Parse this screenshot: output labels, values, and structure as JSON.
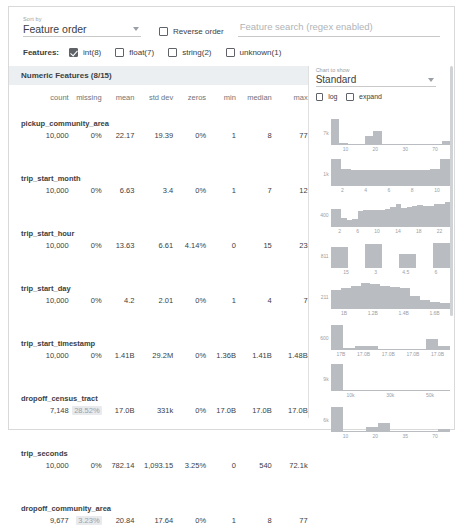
{
  "controls": {
    "sort_caption": "Sort by",
    "sort_value": "Feature order",
    "reverse_label": "Reverse order",
    "reverse_checked": false,
    "search_placeholder": "Feature search (regex enabled)",
    "search_value": "",
    "features_label": "Features:",
    "feature_types": [
      {
        "label": "int(8)",
        "checked": true
      },
      {
        "label": "float(7)",
        "checked": false
      },
      {
        "label": "string(2)",
        "checked": false
      },
      {
        "label": "unknown(1)",
        "checked": false
      }
    ]
  },
  "chart_panel": {
    "caption": "Chart to show",
    "selected": "Standard",
    "options": [
      {
        "label": "log",
        "checked": false
      },
      {
        "label": "expand",
        "checked": false
      }
    ]
  },
  "table": {
    "section_title": "Numeric Features (8/15)",
    "columns": [
      "count",
      "missing",
      "mean",
      "std dev",
      "zeros",
      "min",
      "median",
      "max"
    ],
    "rows": [
      {
        "name": "pickup_community_area",
        "count": "10,000",
        "missing": "0%",
        "missing_alert": false,
        "mean": "22.17",
        "std_dev": "19.39",
        "zeros": "0%",
        "min": "1",
        "median": "8",
        "max": "77"
      },
      {
        "name": "trip_start_month",
        "count": "10,000",
        "missing": "0%",
        "missing_alert": false,
        "mean": "6.63",
        "std_dev": "3.4",
        "zeros": "0%",
        "min": "1",
        "median": "7",
        "max": "12"
      },
      {
        "name": "trip_start_hour",
        "count": "10,000",
        "missing": "0%",
        "missing_alert": false,
        "mean": "13.63",
        "std_dev": "6.61",
        "zeros": "4.14%",
        "min": "0",
        "median": "15",
        "max": "23"
      },
      {
        "name": "trip_start_day",
        "count": "10,000",
        "missing": "0%",
        "missing_alert": false,
        "mean": "4.2",
        "std_dev": "2.01",
        "zeros": "0%",
        "min": "1",
        "median": "4",
        "max": "7"
      },
      {
        "name": "trip_start_timestamp",
        "count": "10,000",
        "missing": "0%",
        "missing_alert": false,
        "mean": "1.41B",
        "std_dev": "29.2M",
        "zeros": "0%",
        "min": "1.36B",
        "median": "1.41B",
        "max": "1.48B"
      },
      {
        "name": "dropoff_census_tract",
        "count": "7,148",
        "missing": "28.52%",
        "missing_alert": true,
        "mean": "17.0B",
        "std_dev": "331k",
        "zeros": "0%",
        "min": "17.0B",
        "median": "17.0B",
        "max": "17.0B"
      },
      {
        "name": "trip_seconds",
        "count": "10,000",
        "missing": "0%",
        "missing_alert": false,
        "mean": "782.14",
        "std_dev": "1,093.15",
        "zeros": "3.25%",
        "min": "0",
        "median": "540",
        "max": "72.1k"
      },
      {
        "name": "dropoff_community_area",
        "count": "9,677",
        "missing": "3.23%",
        "missing_alert": true,
        "mean": "20.84",
        "std_dev": "17.64",
        "zeros": "0%",
        "min": "1",
        "median": "8",
        "max": "77"
      }
    ]
  },
  "chart_data": [
    {
      "type": "bar",
      "feature": "pickup_community_area",
      "ylabel": "7k",
      "xlabel": "",
      "tick_labels": [
        "10",
        "20",
        "30",
        "70"
      ],
      "values": [
        92,
        4,
        3,
        2,
        30,
        48,
        3,
        2,
        2,
        2,
        2,
        2,
        2,
        14
      ],
      "ylim": [
        0,
        100
      ]
    },
    {
      "type": "bar",
      "feature": "trip_start_month",
      "ylabel": "1k",
      "xlabel": "",
      "tick_labels": [
        "2",
        "4",
        "6",
        "8",
        "10"
      ],
      "values": [
        96,
        58,
        56,
        56,
        55,
        55,
        55,
        55,
        56,
        57,
        58,
        96
      ],
      "ylim": [
        0,
        100
      ]
    },
    {
      "type": "bar",
      "feature": "trip_start_hour",
      "ylabel": "400",
      "xlabel": "",
      "tick_labels": [
        "2",
        "6",
        "10",
        "14",
        "18",
        "22"
      ],
      "values": [
        62,
        62,
        30,
        22,
        26,
        56,
        58,
        58,
        58,
        60,
        62,
        70,
        80,
        66,
        70,
        72,
        78,
        72,
        72,
        82,
        82,
        88
      ],
      "ylim": [
        0,
        100
      ]
    },
    {
      "type": "bar",
      "feature": "trip_start_day",
      "ylabel": "811",
      "xlabel": "",
      "tick_labels": [
        "15",
        "3",
        "4.5",
        "6"
      ],
      "values": [
        72,
        0,
        84,
        0,
        50,
        0,
        88
      ],
      "ylim": [
        0,
        100
      ]
    },
    {
      "type": "bar",
      "feature": "trip_start_timestamp",
      "ylabel": "211",
      "xlabel": "",
      "tick_labels": [
        "1B",
        "1.2B",
        "1.4B",
        "1.6B"
      ],
      "values": [
        66,
        72,
        82,
        90,
        88,
        82,
        78,
        72,
        44,
        30,
        22,
        18
      ],
      "ylim": [
        0,
        100
      ]
    },
    {
      "type": "bar",
      "feature": "dropoff_census_tract",
      "ylabel": "600",
      "xlabel": "",
      "tick_labels": [
        "17B",
        "17.0B",
        "17.0B",
        "17.0B",
        "17.0B"
      ],
      "values": [
        88,
        4,
        14,
        12,
        2,
        2,
        2,
        2,
        36,
        14
      ],
      "ylim": [
        0,
        100
      ]
    },
    {
      "type": "bar",
      "feature": "trip_seconds",
      "ylabel": "9k",
      "xlabel": "",
      "tick_labels": [
        "10k",
        "30k",
        "50k"
      ],
      "values": [
        94,
        2,
        1,
        1,
        1,
        1,
        1,
        1,
        1,
        1
      ],
      "ylim": [
        0,
        100
      ]
    },
    {
      "type": "bar",
      "feature": "dropoff_community_area",
      "ylabel": "6k",
      "xlabel": "",
      "tick_labels": [
        "10",
        "20",
        "35",
        "70"
      ],
      "values": [
        88,
        3,
        2,
        16,
        30,
        2,
        2,
        2,
        2,
        8
      ],
      "ylim": [
        0,
        100
      ]
    }
  ]
}
